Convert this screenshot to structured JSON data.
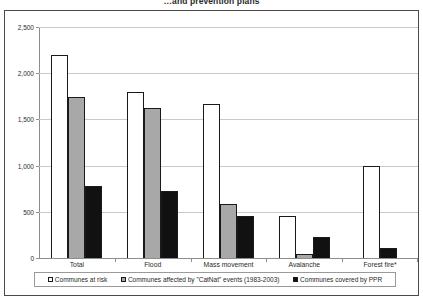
{
  "chart_data": {
    "type": "bar",
    "title": "…and prevention plans",
    "xlabel": "",
    "ylabel": "",
    "ylim": [
      0,
      2500
    ],
    "ytick_labels": [
      "0",
      "500",
      "1,000",
      "1,500",
      "2,000",
      "2,500"
    ],
    "ytick_values": [
      0,
      500,
      1000,
      1500,
      2000,
      2500
    ],
    "grid": true,
    "legend_position": "bottom",
    "categories": [
      "Total",
      "Flood",
      "Mass movement",
      "Avalanche",
      "Forest fire*"
    ],
    "series": [
      {
        "name": "Communes at risk",
        "color": "#ffffff",
        "values": [
          2200,
          1800,
          1670,
          450,
          1000
        ]
      },
      {
        "name": "Communes affected by \"CatNat\" events (1983-2003)",
        "color": "#a8a8a8",
        "values": [
          1740,
          1620,
          580,
          45,
          0
        ]
      },
      {
        "name": "Communes covered by PPR",
        "color": "#111111",
        "values": [
          780,
          730,
          450,
          230,
          110
        ]
      }
    ]
  },
  "colors": {
    "series_at_risk": "#ffffff",
    "series_catnat": "#a8a8a8",
    "series_ppr": "#111111",
    "axis": "#8d8d8d",
    "gridline": "#c9c9c9",
    "frame": "#4a4a4a",
    "text": "#2b2b2b"
  }
}
